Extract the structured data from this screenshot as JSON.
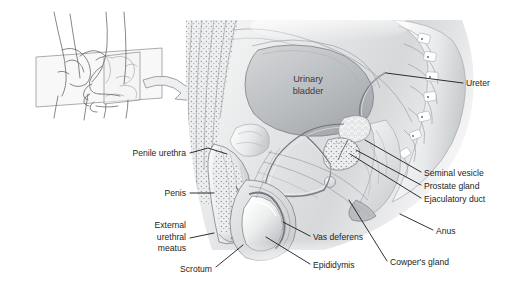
{
  "figure": {
    "background_color": "#ffffff",
    "ink_color": "#231f20",
    "leader_color": "#1a1a1a"
  },
  "inset": {
    "name": "orientation-insets",
    "arrow_label": "sagittal-plane-arrow",
    "panels": [
      {
        "label": "hand-through-plane-lateral"
      },
      {
        "label": "fist-with-plane-frontal"
      }
    ]
  },
  "internal_labels": [
    {
      "id": "urinary-bladder",
      "lines": [
        "Urinary",
        "bladder"
      ],
      "x": 308,
      "y": 82
    }
  ],
  "labels_left": [
    {
      "id": "penile-urethra",
      "lines": [
        "Penile urethra"
      ],
      "text_x": 186,
      "text_y": 156,
      "anchor": "end",
      "leader": "M190,153 L208,148 L227,154"
    },
    {
      "id": "penis",
      "lines": [
        "Penis"
      ],
      "text_x": 186,
      "text_y": 196,
      "anchor": "end",
      "leader": "M190,193 L214,193"
    },
    {
      "id": "external-urethral-meatus",
      "lines": [
        "External",
        "urethral",
        "meatus"
      ],
      "text_x": 186,
      "text_y": 228,
      "anchor": "end",
      "leader": "M190,238 L214,233"
    },
    {
      "id": "scrotum",
      "lines": [
        "Scrotum"
      ],
      "text_x": 212,
      "text_y": 272,
      "anchor": "end",
      "leader": "M216,267 L243,245"
    }
  ],
  "labels_right": [
    {
      "id": "ureter",
      "lines": [
        "Ureter"
      ],
      "text_x": 466,
      "text_y": 86,
      "anchor": "start",
      "leader": "M463,83 L386,73"
    },
    {
      "id": "seminal-vesicle",
      "lines": [
        "Seminal vesicle"
      ],
      "text_x": 424,
      "text_y": 176,
      "anchor": "start",
      "leader": "M421,172 L365,140"
    },
    {
      "id": "prostate-gland",
      "lines": [
        "Prostate gland"
      ],
      "text_x": 424,
      "text_y": 189,
      "anchor": "start",
      "leader": "M421,185 L356,150"
    },
    {
      "id": "ejaculatory-duct",
      "lines": [
        "Ejaculatory duct"
      ],
      "text_x": 424,
      "text_y": 202,
      "anchor": "start",
      "leader": "M421,198 L350,154"
    },
    {
      "id": "anus",
      "lines": [
        "Anus"
      ],
      "text_x": 436,
      "text_y": 234,
      "anchor": "start",
      "leader": "M433,230 L400,214"
    }
  ],
  "labels_bottom": [
    {
      "id": "vas-deferens",
      "lines": [
        "Vas deferens"
      ],
      "text_x": 313,
      "text_y": 240,
      "anchor": "start",
      "leader": "M310,236 L283,222"
    },
    {
      "id": "epididymis",
      "lines": [
        "Epididymis"
      ],
      "text_x": 313,
      "text_y": 268,
      "anchor": "start",
      "leader": "M310,264 L266,237"
    },
    {
      "id": "cowpers-gland",
      "lines": [
        "Cowper's gland"
      ],
      "text_x": 390,
      "text_y": 265,
      "anchor": "start",
      "leader": "M387,261 L349,200"
    }
  ]
}
